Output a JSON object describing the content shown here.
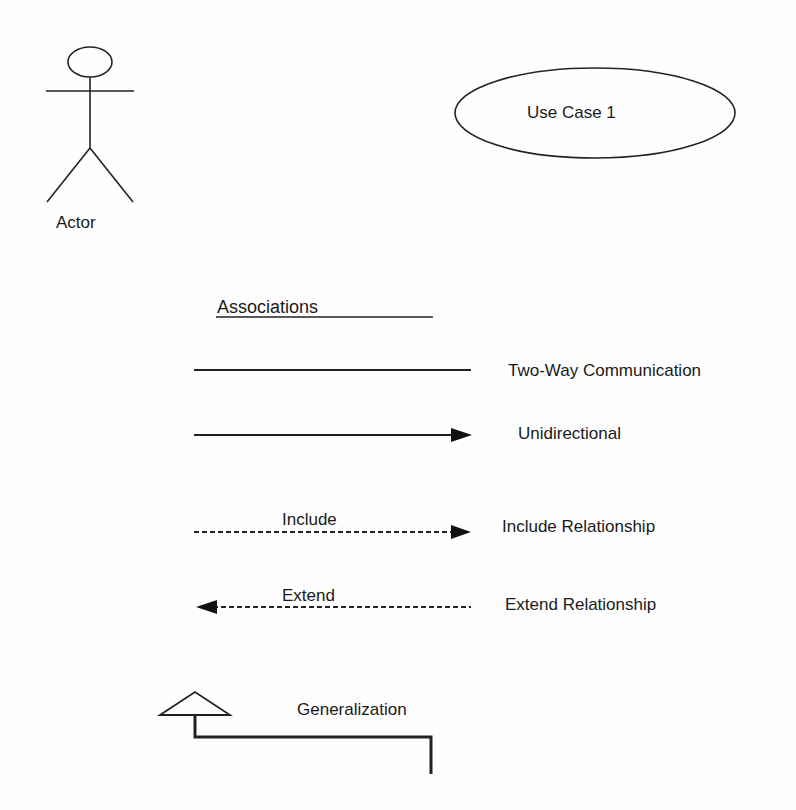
{
  "diagram": {
    "type": "UML use case notation legend",
    "actor": {
      "label": "Actor"
    },
    "use_case": {
      "label": "Use Case 1"
    },
    "associations": {
      "heading": "Associations",
      "items": [
        {
          "label": "Two-Way Communication",
          "line": "solid",
          "arrow": "none",
          "on_line_label": ""
        },
        {
          "label": "Unidirectional",
          "line": "solid",
          "arrow": "right",
          "on_line_label": ""
        },
        {
          "label": "Include Relationship",
          "line": "dashed",
          "arrow": "right",
          "on_line_label": "Include"
        },
        {
          "label": "Extend Relationship",
          "line": "dashed",
          "arrow": "left",
          "on_line_label": "Extend"
        }
      ]
    },
    "generalization": {
      "label": "Generalization",
      "arrow": "hollow-triangle"
    }
  }
}
